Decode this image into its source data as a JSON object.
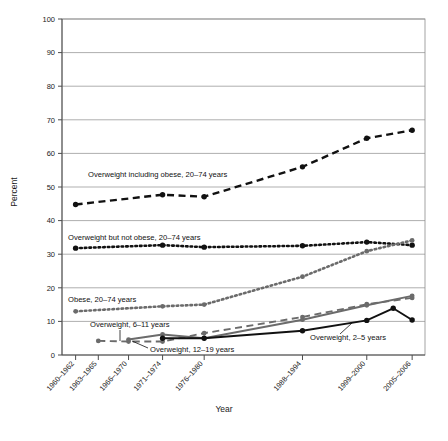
{
  "figure": {
    "ylabel": "Percent",
    "xlabel": "Year",
    "y_ticks": [
      "0",
      "10",
      "20",
      "30",
      "40",
      "50",
      "60",
      "70",
      "80",
      "90",
      "100"
    ],
    "x_ticks": [
      "1960-1962",
      "1963-1965",
      "1966-1970",
      "1971-1974",
      "1976-1980",
      "1988-1994",
      "1999-2000",
      "2005-2006"
    ],
    "colors": {
      "ink": "#111111",
      "grid": "#8c8c8c",
      "axis": "#4d4d4d",
      "gray_series": "#6b6b6b",
      "background": "#ffffff"
    }
  },
  "labels": {
    "overweight_including_obese": "Overweight including obese, 20–74 years",
    "overweight_not_obese": "Overweight but not obese, 20–74 years",
    "obese_adults": "Obese, 20–74 years",
    "overweight_6_11": "Overweight, 6–11 years",
    "overweight_12_19": "Overweight, 12–19 years",
    "overweight_2_5": "Overweight, 2–5 years"
  },
  "chart_data": {
    "type": "line",
    "title": "",
    "xlabel": "Year",
    "ylabel": "Percent",
    "ylim": [
      0,
      100
    ],
    "ytick_interval": 10,
    "grid": true,
    "legend": "inline-annotations",
    "categories": [
      "1960-1962",
      "1963-1965",
      "1966-1970",
      "1971-1974",
      "1976-1980",
      "1988-1994",
      "1999-2000",
      "2005-2006"
    ],
    "x_positions": [
      1961,
      1964,
      1968,
      1972.5,
      1978,
      1991,
      1999.5,
      2005.5
    ],
    "series": [
      {
        "name": "Overweight including obese, 20–74 years",
        "style": "dashed",
        "color": "#111111",
        "x": [
          1961,
          1972.5,
          1978,
          1991,
          1999.5,
          2005.5
        ],
        "values": [
          44.8,
          47.7,
          47.1,
          56.0,
          64.5,
          66.9
        ]
      },
      {
        "name": "Overweight but not obese, 20–74 years",
        "style": "dotted",
        "color": "#111111",
        "x": [
          1961,
          1972.5,
          1978,
          1991,
          1999.5,
          2005.5
        ],
        "values": [
          31.8,
          32.7,
          32.1,
          32.5,
          33.6,
          32.7
        ]
      },
      {
        "name": "Obese, 20–74 years",
        "style": "dotted",
        "color": "#6b6b6b",
        "x": [
          1961,
          1972.5,
          1978,
          1991,
          1999.5,
          2005.5
        ],
        "values": [
          13.0,
          14.5,
          15.0,
          23.3,
          30.9,
          34.1
        ]
      },
      {
        "name": "Overweight, 6–11 years",
        "style": "dashed",
        "color": "#6b6b6b",
        "x": [
          1964,
          1968,
          1972.5,
          1978,
          1991,
          1999.5,
          2005.5
        ],
        "values": [
          4.2,
          4.0,
          4.0,
          6.5,
          11.3,
          15.1,
          17.0
        ]
      },
      {
        "name": "Overweight, 12–19 years",
        "style": "solid",
        "color": "#6b6b6b",
        "x": [
          1968,
          1972.5,
          1978,
          1991,
          1999.5,
          2005.5
        ],
        "values": [
          4.6,
          6.1,
          5.0,
          10.5,
          14.8,
          17.6
        ]
      },
      {
        "name": "Overweight, 2–5 years",
        "style": "solid",
        "color": "#111111",
        "x": [
          1972.5,
          1978,
          1991,
          1999.5,
          2003,
          2005.5
        ],
        "values": [
          5.0,
          5.0,
          7.2,
          10.3,
          13.9,
          10.4
        ]
      }
    ]
  }
}
